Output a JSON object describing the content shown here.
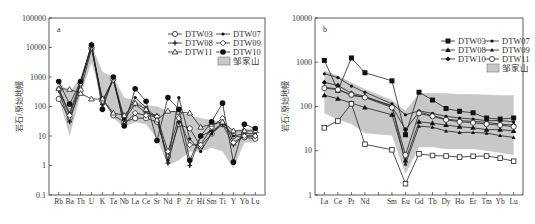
{
  "chart_data": [
    {
      "type": "line",
      "panel": "a",
      "title": "",
      "xlabel": "",
      "ylabel": "岩石/原始地幔",
      "yscale": "log",
      "ylim": [
        0.1,
        100000
      ],
      "yticks": [
        "100000",
        "10000",
        "1000",
        "100",
        "10",
        "1",
        "0.1"
      ],
      "categories": [
        "Rb",
        "Ba",
        "Th",
        "U",
        "K",
        "Ta",
        "Nb",
        "La",
        "Ce",
        "Sr",
        "Nd",
        "P",
        "Zr",
        "Hf",
        "Sm",
        "Ti",
        "Y",
        "Yb",
        "Lu"
      ],
      "band_label": "邹家山",
      "band_upper": [
        700,
        300,
        1000,
        13000,
        1500,
        1000,
        200,
        160,
        110,
        100,
        70,
        70,
        50,
        40,
        35,
        30,
        15,
        18,
        18
      ],
      "band_lower": [
        200,
        10,
        250,
        3000,
        200,
        40,
        20,
        30,
        25,
        8,
        1,
        1.5,
        3,
        3,
        4,
        3,
        0.8,
        6,
        6
      ],
      "series": [
        {
          "name": "DTW03",
          "marker": "circle-open",
          "values": [
            180,
            40,
            350,
            9000,
            180,
            50,
            30,
            40,
            40,
            30,
            2,
            25,
            18,
            4.5,
            12,
            25,
            10,
            9,
            8
          ]
        },
        {
          "name": "DTW07",
          "marker": "dot",
          "values": [
            400,
            60,
            700,
            12000,
            150,
            900,
            40,
            200,
            90,
            40,
            1.5,
            200,
            8,
            3,
            12,
            30,
            10,
            12,
            12
          ]
        },
        {
          "name": "DTW08",
          "marker": "star",
          "values": [
            350,
            30,
            600,
            13000,
            120,
            800,
            35,
            120,
            60,
            50,
            1.2,
            30,
            1,
            10,
            15,
            25,
            5,
            10,
            10
          ]
        },
        {
          "name": "DTW09",
          "marker": "diamond-open",
          "values": [
            400,
            50,
            600,
            10000,
            150,
            800,
            25,
            60,
            50,
            45,
            3,
            40,
            5,
            5,
            20,
            40,
            6,
            10,
            10
          ]
        },
        {
          "name": "DTW11",
          "marker": "triangle-open",
          "values": [
            400,
            380,
            280,
            180,
            180,
            60,
            50,
            130,
            80,
            35,
            70,
            65,
            60,
            20,
            25,
            30,
            15,
            15,
            15
          ]
        },
        {
          "name": "DTW10",
          "marker": "dot-large",
          "values": [
            700,
            120,
            700,
            12000,
            80,
            1000,
            22,
            400,
            150,
            7,
            200,
            80,
            1.5,
            10,
            30,
            130,
            1.3,
            25,
            18
          ]
        }
      ]
    },
    {
      "type": "line",
      "panel": "b",
      "title": "",
      "xlabel": "",
      "ylabel": "岩石/原始地幔",
      "yscale": "log",
      "ylim": [
        1,
        10000
      ],
      "yticks": [
        "10000",
        "1000",
        "100",
        "10",
        "1"
      ],
      "categories": [
        "La",
        "Ce",
        "Pr",
        "Nd",
        "",
        "Sm",
        "Eu",
        "Gd",
        "Tb",
        "Dy",
        "Ho",
        "Er",
        "Tm",
        "Yb",
        "Lu"
      ],
      "band_label": "邹家山",
      "band_upper": [
        650,
        500,
        350,
        250,
        null,
        140,
        80,
        200,
        200,
        200,
        190,
        190,
        185,
        180,
        180
      ],
      "band_lower": [
        70,
        50,
        40,
        25,
        null,
        22,
        3,
        12,
        12,
        11,
        11,
        11,
        10,
        9,
        8
      ],
      "series": [
        {
          "name": "DTW03",
          "marker": "square-filled",
          "values": [
            1100,
            230,
            1250,
            580,
            null,
            380,
            23,
            210,
            140,
            90,
            78,
            72,
            55,
            52,
            55
          ]
        },
        {
          "name": "DTW07",
          "marker": "dot",
          "values": [
            550,
            450,
            290,
            210,
            null,
            115,
            65,
            80,
            70,
            60,
            55,
            52,
            48,
            48,
            45
          ]
        },
        {
          "name": "DTW08",
          "marker": "triangle-filled",
          "values": [
            180,
            150,
            120,
            95,
            null,
            65,
            6,
            45,
            42,
            38,
            35,
            33,
            30,
            30,
            28
          ]
        },
        {
          "name": "DTW09",
          "marker": "triangle-small",
          "values": [
            270,
            250,
            175,
            165,
            null,
            105,
            5,
            36,
            34,
            28,
            26,
            26,
            25,
            22,
            20
          ]
        },
        {
          "name": "DTW10",
          "marker": "diamond-filled",
          "values": [
            350,
            300,
            200,
            170,
            null,
            100,
            30,
            75,
            62,
            52,
            48,
            46,
            44,
            40,
            38
          ]
        },
        {
          "name": "DTW11",
          "marker": "circle-open",
          "values": [
            260,
            240,
            185,
            160,
            null,
            95,
            8,
            70,
            60,
            50,
            45,
            43,
            40,
            38,
            35
          ]
        },
        {
          "name": "DTW11-low",
          "marker": "square-open",
          "legend": false,
          "values": [
            33,
            47,
            115,
            14,
            null,
            10.5,
            1.8,
            8.5,
            7.8,
            7.6,
            7.2,
            7.5,
            7.6,
            6.8,
            5.8
          ]
        }
      ]
    }
  ],
  "legend_a": [
    "DTW03",
    "DTW07",
    "DTW08",
    "DTW09",
    "DTW11",
    "DTW10"
  ],
  "legend_b": [
    "DTW03",
    "DTW07",
    "DTW08",
    "DTW09",
    "DTW10",
    "DTW11"
  ],
  "band_label": "邹家山",
  "panel_a_label": "a",
  "panel_b_label": "b",
  "ylabel": "岩石/原始地幔",
  "caption": ""
}
